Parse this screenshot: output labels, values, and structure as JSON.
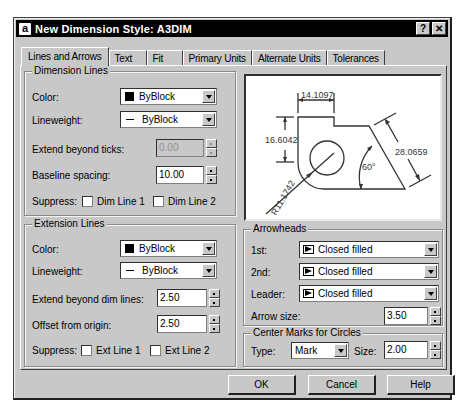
{
  "window": {
    "title": "New Dimension Style: A3DIM",
    "app_icon": "a",
    "help_button": "?",
    "close_button": "✕"
  },
  "tabs": [
    {
      "label": "Lines and Arrows",
      "active": true
    },
    {
      "label": "Text",
      "active": false
    },
    {
      "label": "Fit",
      "active": false
    },
    {
      "label": "Primary Units",
      "active": false
    },
    {
      "label": "Alternate Units",
      "active": false
    },
    {
      "label": "Tolerances",
      "active": false
    }
  ],
  "dimension_lines": {
    "title": "Dimension Lines",
    "color_label": "Color:",
    "color_value": "ByBlock",
    "lineweight_label": "Lineweight:",
    "lineweight_value": "ByBlock",
    "extend_label": "Extend beyond ticks:",
    "extend_value": "0.00",
    "baseline_label": "Baseline spacing:",
    "baseline_value": "10.00",
    "suppress_label": "Suppress:",
    "dim_line1_label": "Dim Line 1",
    "dim_line2_label": "Dim Line 2"
  },
  "extension_lines": {
    "title": "Extension Lines",
    "color_label": "Color:",
    "color_value": "ByBlock",
    "lineweight_label": "Lineweight:",
    "lineweight_value": "ByBlock",
    "extend_label": "Extend beyond dim lines:",
    "extend_value": "2.50",
    "offset_label": "Offset from origin:",
    "offset_value": "2.50",
    "suppress_label": "Suppress:",
    "ext_line1_label": "Ext Line 1",
    "ext_line2_label": "Ext Line 2"
  },
  "preview": {
    "dim_top": "14.1097",
    "dim_left": "16.6042",
    "dim_right": "28.0659",
    "dim_angle": "60°",
    "dim_radius": "R11.1742"
  },
  "arrowheads": {
    "title": "Arrowheads",
    "first_label": "1st:",
    "first_value": "Closed filled",
    "second_label": "2nd:",
    "second_value": "Closed filled",
    "leader_label": "Leader:",
    "leader_value": "Closed filled",
    "size_label": "Arrow size:",
    "size_value": "3.50"
  },
  "center_marks": {
    "title": "Center Marks for Circles",
    "type_label": "Type:",
    "type_value": "Mark",
    "size_label": "Size:",
    "size_value": "2.00"
  },
  "buttons": {
    "ok": "OK",
    "cancel": "Cancel",
    "help": "Help"
  }
}
